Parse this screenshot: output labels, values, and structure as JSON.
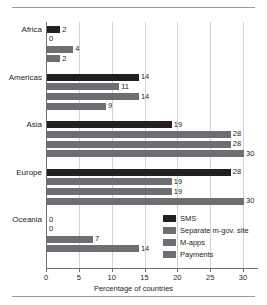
{
  "figure": {
    "axis_title": "Percentage of countries"
  },
  "legend": {
    "items": [
      {
        "label": "SMS",
        "color": "#231f20"
      },
      {
        "label": "Separate m-gov. site",
        "color": "#6d6e71"
      },
      {
        "label": "M-apps",
        "color": "#6d6e71"
      },
      {
        "label": "Payments",
        "color": "#6d6e71"
      }
    ]
  },
  "chart_data": {
    "type": "bar",
    "orientation": "horizontal",
    "title": "",
    "subtitle": "",
    "xlabel": "Percentage of countries",
    "ylabel": "",
    "xlim": [
      0,
      32
    ],
    "xticks": [
      0,
      5,
      10,
      15,
      20,
      25,
      30
    ],
    "xticklabels": [
      "0",
      "5",
      "10",
      "15",
      "20",
      "25",
      "30"
    ],
    "grid": true,
    "legend_position": "inside-bottom-right",
    "categories": [
      "Africa",
      "Americas",
      "Asia",
      "Europe",
      "Oceania"
    ],
    "series": [
      {
        "name": "SMS",
        "color": "#231f20",
        "values": [
          2,
          14,
          19,
          28,
          0
        ]
      },
      {
        "name": "Separate m-gov. site",
        "color": "#6d6e71",
        "values": [
          0,
          11,
          28,
          19,
          0
        ]
      },
      {
        "name": "M-apps",
        "color": "#6d6e71",
        "values": [
          4,
          14,
          28,
          19,
          7
        ]
      },
      {
        "name": "Payments",
        "color": "#6d6e71",
        "values": [
          2,
          9,
          30,
          30,
          14
        ]
      }
    ],
    "value_labels": {
      "Africa": [
        "2",
        "0",
        "4",
        "2"
      ],
      "Americas": [
        "14",
        "11",
        "14",
        "9"
      ],
      "Asia": [
        "19",
        "28",
        "28",
        "30"
      ],
      "Europe": [
        "28",
        "19",
        "19",
        "30"
      ],
      "Oceania": [
        "0",
        "0",
        "7",
        "14"
      ]
    }
  }
}
